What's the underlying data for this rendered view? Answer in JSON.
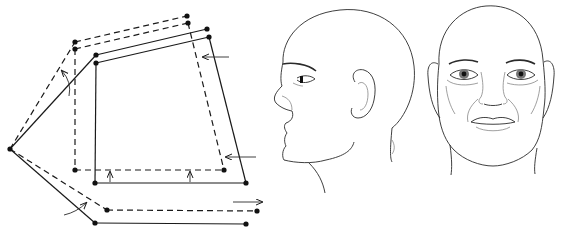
{
  "figure": {
    "diagram": {
      "vertex": [
        10,
        149
      ],
      "dashed_frame": {
        "top_left_outer": [
          75,
          42
        ],
        "top_left_inner": [
          75,
          49
        ],
        "top_right_outer": [
          187,
          16
        ],
        "top_right_inner": [
          188,
          23
        ],
        "bottom_left": [
          75,
          170
        ],
        "bottom_right": [
          224,
          170
        ],
        "lower_bar": [
          [
            107,
            210
          ],
          [
            257,
            211
          ]
        ]
      },
      "solid_frame": {
        "top_left_outer": [
          96,
          55
        ],
        "top_left_inner": [
          96,
          63
        ],
        "top_right_outer": [
          207,
          29
        ],
        "top_right_inner": [
          209,
          37
        ],
        "bottom_left": [
          95,
          183
        ],
        "bottom_right": [
          246,
          183
        ],
        "lower_bar": [
          [
            95,
            223
          ],
          [
            246,
            224
          ]
        ]
      },
      "arrows": [
        {
          "name": "left-arrow-upper",
          "direction": "left"
        },
        {
          "name": "left-arrow-lower",
          "direction": "left"
        },
        {
          "name": "up-arrow-left",
          "direction": "up"
        },
        {
          "name": "up-arrow-right",
          "direction": "up"
        },
        {
          "name": "right-arrow-bottom",
          "direction": "right"
        },
        {
          "name": "curved-arrow-top",
          "direction": "up-curve"
        },
        {
          "name": "curved-arrow-bottom",
          "direction": "right-curve"
        }
      ]
    },
    "faces": [
      {
        "name": "profile-view",
        "view": "left profile"
      },
      {
        "name": "frontal-view",
        "view": "front"
      }
    ],
    "colors": {
      "line": "#1a1a1a",
      "background": "#ffffff"
    }
  }
}
